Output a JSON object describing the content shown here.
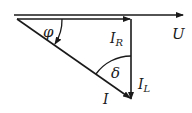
{
  "diagram": {
    "type": "phasor-diagram",
    "labels": {
      "voltage": "U",
      "resistive_current": "I",
      "resistive_sub": "R",
      "inductive_current": "I",
      "inductive_sub": "L",
      "total_current": "I",
      "phase_angle": "φ",
      "loss_angle": "δ"
    },
    "colors": {
      "stroke": "#1a1a1a",
      "background": "#ffffff"
    }
  }
}
